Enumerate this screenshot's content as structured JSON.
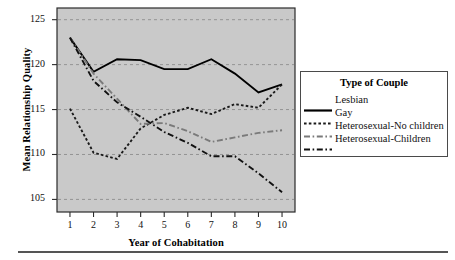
{
  "chart_data": {
    "type": "line",
    "title": "",
    "xlabel": "Year of Cohabitation",
    "ylabel": "Mean Relationship Quality",
    "x": [
      1,
      2,
      3,
      4,
      5,
      6,
      7,
      8,
      9,
      10
    ],
    "xtick_labels": [
      "1",
      "2",
      "3",
      "4",
      "5",
      "6",
      "7",
      "8",
      "9",
      "10"
    ],
    "ytick_labels": [
      "105",
      "110",
      "115",
      "120",
      "125"
    ],
    "yticks": [
      105,
      110,
      115,
      120,
      125
    ],
    "xlim": [
      0.45,
      10.55
    ],
    "ylim": [
      103.6,
      126.3
    ],
    "grid": "horizontal-dashed",
    "legend_position": "right",
    "legend_title": "Type of Couple",
    "plot_background": "#c9c9c9",
    "series": [
      {
        "name": "Lesbian",
        "style": "solid",
        "color": "#000000",
        "values": [
          123.0,
          119.2,
          120.6,
          120.5,
          119.5,
          119.5,
          120.6,
          119.0,
          116.9,
          117.8
        ]
      },
      {
        "name": "Gay",
        "style": "dotted",
        "color": "#1a1a1a",
        "values": [
          115.1,
          110.2,
          109.5,
          112.9,
          114.4,
          115.2,
          114.5,
          115.6,
          115.2,
          117.8
        ]
      },
      {
        "name": "Heterosexual-No children",
        "style": "dash-dot-light",
        "color": "#7a7a7a",
        "values": [
          123.0,
          119.0,
          116.2,
          113.4,
          113.5,
          112.6,
          111.4,
          111.9,
          112.4,
          112.7
        ]
      },
      {
        "name": "Heterosexual-Children",
        "style": "dash-dot-dark",
        "color": "#111111",
        "values": [
          123.0,
          118.2,
          115.8,
          114.2,
          112.5,
          111.3,
          109.8,
          109.8,
          107.9,
          105.8
        ]
      }
    ]
  },
  "legend": {
    "title": "Type of Couple",
    "entries": [
      {
        "label": "Lesbian",
        "style": "solid"
      },
      {
        "label": "Gay",
        "style": "dotted"
      },
      {
        "label": "Heterosexual-No children",
        "style": "dash-dot-light"
      },
      {
        "label": "Heterosexual-Children",
        "style": "dash-dot-dark"
      }
    ]
  },
  "axes": {
    "y_title": "Mean Relationship Quality",
    "x_title": "Year of Cohabitation"
  }
}
